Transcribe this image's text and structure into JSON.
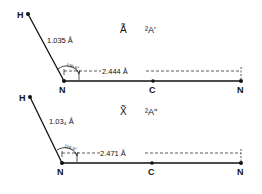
{
  "panels": [
    {
      "state_symbol": "Ã",
      "state_term": "²A′",
      "atoms": {
        "h": "H",
        "n1": "N",
        "c": "C",
        "n2": "N"
      },
      "nh_bond_length": "1.035 Å",
      "nn_distance": "2.444 Å",
      "angle": "120.6°"
    },
    {
      "state_symbol": "X̃",
      "state_term": "²A″",
      "atoms": {
        "h": "H",
        "n1": "N",
        "c": "C",
        "n2": "N"
      },
      "nh_bond_length": "1.03₄ Å",
      "nn_distance": "2.471 Å",
      "angle": "116.5°"
    }
  ],
  "colors": {
    "ink": "#111111",
    "background": "#ffffff"
  }
}
